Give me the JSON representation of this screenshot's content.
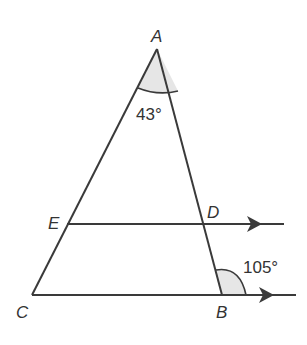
{
  "diagram": {
    "type": "geometry",
    "points": {
      "A": "A",
      "B": "B",
      "C": "C",
      "D": "D",
      "E": "E"
    },
    "angles": {
      "at_A": "43°",
      "at_B_exterior": "105°"
    },
    "parallel_lines": [
      "ED",
      "CB"
    ],
    "colors": {
      "stroke": "#3a3a3a",
      "angle_fill": "#e6e6e6"
    }
  }
}
